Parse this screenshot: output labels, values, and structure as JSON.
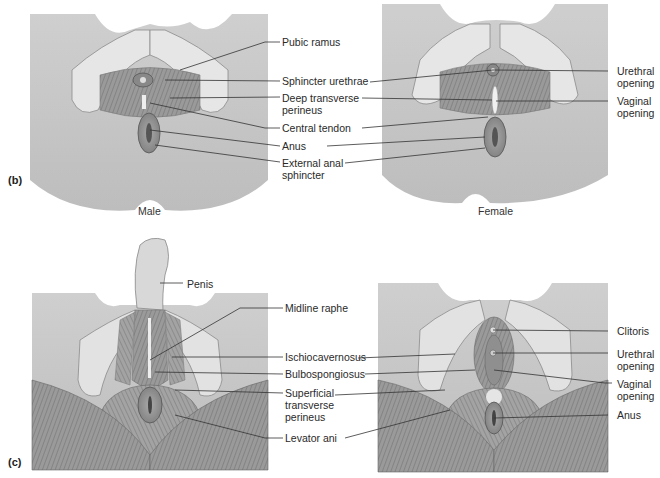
{
  "panels": {
    "b": {
      "tag": "(b)",
      "male_caption": "Male",
      "female_caption": "Female",
      "center_labels": {
        "pubic_ramus": "Pubic ramus",
        "sphincter_urethrae": "Sphincter urethrae",
        "deep_transverse_perineus": [
          "Deep transverse",
          "perineus"
        ],
        "central_tendon": "Central tendon",
        "anus": "Anus",
        "external_anal_sphincter": [
          "External anal",
          "sphincter"
        ]
      },
      "female_right_labels": {
        "urethral_opening": [
          "Urethral",
          "opening"
        ],
        "vaginal_opening": [
          "Vaginal",
          "opening"
        ]
      }
    },
    "c": {
      "tag": "(c)",
      "male_labels": {
        "penis": "Penis"
      },
      "center_labels": {
        "midline_raphe": "Midline raphe",
        "ischiocavernosus": "Ischiocavernosus",
        "bulbospongiosus": "Bulbospongiosus",
        "superficial_transverse_perineus": [
          "Superficial",
          "transverse",
          "perineus"
        ],
        "levator_ani": "Levator ani"
      },
      "female_right_labels": {
        "clitoris": "Clitoris",
        "urethral_opening": [
          "Urethral",
          "opening"
        ],
        "vaginal_opening": [
          "Vaginal",
          "opening"
        ],
        "anus": "Anus"
      }
    }
  }
}
